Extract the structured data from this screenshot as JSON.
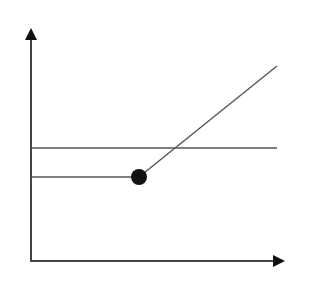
{
  "diagram": {
    "type": "line-diagram",
    "colors": {
      "background": "#ffffff",
      "line": "#555555",
      "axis": "#444444",
      "arrowhead": "#111111",
      "point": "#111111"
    },
    "axes": {
      "y_axis": {
        "x": 31,
        "y_top": 28,
        "y_bottom": 262
      },
      "x_axis": {
        "y": 261,
        "x_left": 31,
        "x_right": 285
      }
    },
    "lines": [
      {
        "name": "upper-horizontal-line",
        "x1": 31,
        "y1": 148,
        "x2": 277,
        "y2": 148
      },
      {
        "name": "lower-horizontal-line",
        "x1": 31,
        "y1": 177,
        "x2": 139,
        "y2": 177
      },
      {
        "name": "rising-line",
        "x1": 139,
        "y1": 177,
        "x2": 277,
        "y2": 66
      }
    ],
    "point": {
      "cx": 139,
      "cy": 177,
      "r": 8
    }
  }
}
